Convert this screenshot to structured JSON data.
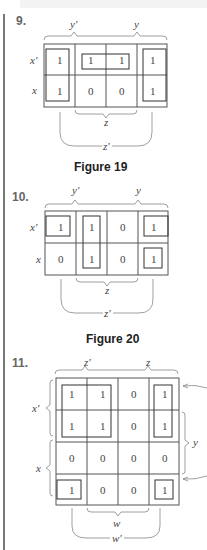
{
  "problems": [
    {
      "number": "9.",
      "caption": "Figure 19",
      "col_labels_top": [
        "y'",
        "y"
      ],
      "col_labels_bottom": [
        "z",
        "z'"
      ],
      "row_labels": [
        "x'",
        "x"
      ],
      "grid": [
        [
          "1",
          "1",
          "1",
          "1"
        ],
        [
          "1",
          "0",
          "0",
          "1"
        ]
      ]
    },
    {
      "number": "10.",
      "caption": "Figure 20",
      "col_labels_top": [
        "y'",
        "y"
      ],
      "col_labels_bottom": [
        "z",
        "z'"
      ],
      "row_labels": [
        "x'",
        "x"
      ],
      "grid": [
        [
          "1",
          "1",
          "0",
          "1"
        ],
        [
          "0",
          "1",
          "0",
          "1"
        ]
      ]
    },
    {
      "number": "11.",
      "col_labels_top": [
        "z'",
        "z"
      ],
      "col_labels_bottom": [
        "w",
        "w'"
      ],
      "row_labels": [
        "x'",
        "x"
      ],
      "side_label": "y",
      "grid": [
        [
          "1",
          "1",
          "0",
          "1"
        ],
        [
          "1",
          "1",
          "0",
          "1"
        ],
        [
          "0",
          "0",
          "0",
          "0"
        ],
        [
          "1",
          "0",
          "0",
          "1"
        ]
      ]
    }
  ]
}
